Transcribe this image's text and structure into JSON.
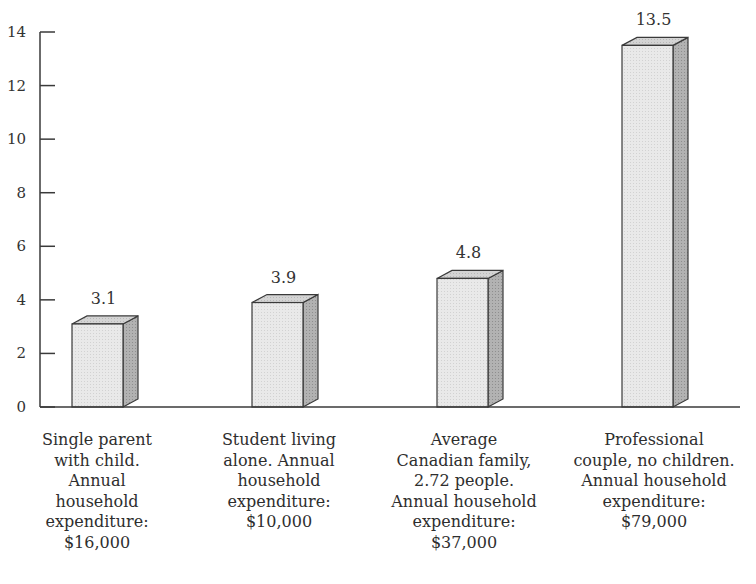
{
  "chart_data": {
    "type": "bar",
    "title": "",
    "xlabel": "",
    "ylabel": "",
    "ylim": [
      0,
      14
    ],
    "yticks": [
      0,
      2,
      4,
      6,
      8,
      10,
      12,
      14
    ],
    "grid": false,
    "legend": null,
    "style": "3d-bars",
    "categories": [
      "Single parent with child. Annual household expenditure: $16,000",
      "Student living alone. Annual household expenditure: $10,000",
      "Average Canadian family, 2.72 people. Annual household expenditure: $37,000",
      "Professional couple, no children. Annual household expenditure: $79,000"
    ],
    "category_lines": [
      [
        "Single parent",
        "with child.",
        "Annual",
        "household",
        "expenditure:",
        "$16,000"
      ],
      [
        "Student living",
        "alone. Annual",
        "household",
        "expenditure:",
        "$10,000"
      ],
      [
        "Average",
        "Canadian family,",
        "2.72 people.",
        "Annual household",
        "expenditure:",
        "$37,000"
      ],
      [
        "Professional",
        "couple, no children.",
        "Annual household",
        "expenditure:",
        "$79,000"
      ]
    ],
    "values": [
      3.1,
      3.9,
      4.8,
      13.5
    ],
    "value_labels": [
      "3.1",
      "3.9",
      "4.8",
      "13.5"
    ]
  },
  "colors": {
    "bar_front": "#e6e6e6",
    "bar_top": "#cfcfcf",
    "bar_side": "#a9a9a9",
    "outline": "#3a3a3a",
    "axis": "#3a3a3a"
  }
}
